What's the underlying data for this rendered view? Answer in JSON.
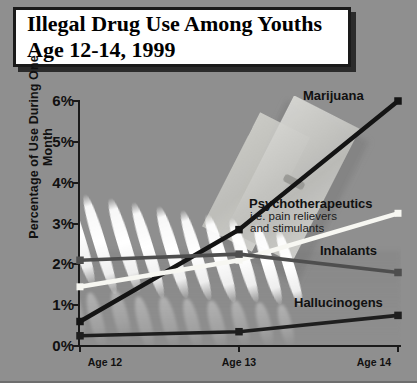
{
  "chart_data": {
    "type": "line",
    "title": "Illegal Drug Use Among Youths Age 12-14, 1999",
    "title_lines": [
      "Illegal Drug Use Among Youths",
      "Age 12-14, 1999"
    ],
    "xlabel": "",
    "ylabel": "Percentage of Use During One Month",
    "categories": [
      "Age 12",
      "Age 13",
      "Age 14"
    ],
    "ylim": [
      0,
      6
    ],
    "ytick_labels": [
      "0%",
      "1%",
      "2%",
      "3%",
      "4%",
      "5%",
      "6%"
    ],
    "ytick_values": [
      0,
      1,
      2,
      3,
      4,
      5,
      6
    ],
    "grid": false,
    "legend": "inline-labels-right",
    "series": [
      {
        "name": "Marijuana",
        "color": "#141414",
        "values": [
          0.6,
          2.85,
          6.0
        ]
      },
      {
        "name": "Psychotherapeutics",
        "sublabel_lines": [
          "i.e. pain relievers",
          "and stimulants"
        ],
        "color": "#f7f7f2",
        "values": [
          1.45,
          2.1,
          3.25
        ]
      },
      {
        "name": "Inhalants",
        "color": "#4e4e4e",
        "values": [
          2.1,
          2.25,
          1.8
        ]
      },
      {
        "name": "Hallucinogens",
        "color": "#1e1e1e",
        "values": [
          0.25,
          0.35,
          0.75
        ]
      }
    ]
  },
  "style": {
    "background_color": "#8f8f8f",
    "axis_color": "#1a1a1a",
    "title_box_bg": "#ffffff",
    "title_box_border": "#1a1a1a"
  },
  "background_photo": {
    "description": "photograph of white powder lines and a razor blade on a gray surface"
  }
}
